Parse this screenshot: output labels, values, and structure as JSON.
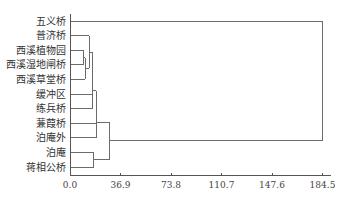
{
  "chart_data": {
    "type": "dendrogram",
    "title": "",
    "xlabel": "",
    "ylabel": "",
    "orientation": "horizontal",
    "xlim": [
      0,
      184.5
    ],
    "x_ticks": [
      0.0,
      36.9,
      73.8,
      110.7,
      147.6,
      184.5
    ],
    "x_tick_labels": [
      "0.0",
      "36.9",
      "73.8",
      "110.7",
      "147.6",
      "184.5"
    ],
    "grid": false,
    "leaves": [
      "五义桥",
      "普济桥",
      "西溪植物园",
      "西溪湿地闸桥",
      "西溪草堂桥",
      "缓冲区",
      "练兵桥",
      "蒹葭桥",
      "泊庵外",
      "泊庵",
      "蒋相公桥"
    ],
    "merges": [
      {
        "id": "c1",
        "children": [
          "西溪植物园",
          "西溪湿地闸桥"
        ],
        "height": 10.2
      },
      {
        "id": "c2",
        "children": [
          "c1",
          "西溪草堂桥"
        ],
        "height": 11.0
      },
      {
        "id": "c3",
        "children": [
          "普济桥",
          "c2"
        ],
        "height": 13.9
      },
      {
        "id": "c4",
        "children": [
          "c3",
          "缓冲区"
        ],
        "height": 16.4
      },
      {
        "id": "c5",
        "children": [
          "c4",
          "练兵桥"
        ],
        "height": 16.6
      },
      {
        "id": "c6",
        "children": [
          "c5",
          "蒹葭桥",
          "泊庵外"
        ],
        "height": 19.0
      },
      {
        "id": "c7",
        "children": [
          "泊庵",
          "蒋相公桥"
        ],
        "height": 17.5
      },
      {
        "id": "c8",
        "children": [
          "c6",
          "c7"
        ],
        "height": 28.5
      },
      {
        "id": "c9",
        "children": [
          "五义桥",
          "c8"
        ],
        "height": 184.5
      }
    ]
  },
  "style": {
    "line_color": "#6b6b6b",
    "axis_color": "#555555",
    "text_color": "#333333"
  }
}
